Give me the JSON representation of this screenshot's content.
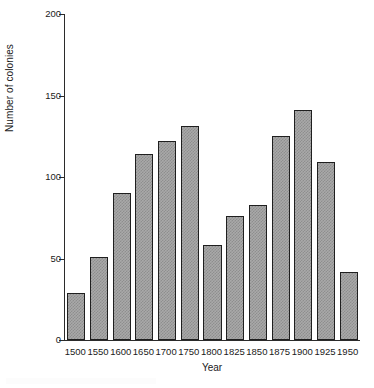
{
  "chart_data": {
    "type": "bar",
    "title": "",
    "xlabel": "Year",
    "ylabel": "Number of colonies",
    "categories": [
      "1500",
      "1550",
      "1600",
      "1650",
      "1700",
      "1750",
      "1800",
      "1825",
      "1850",
      "1875",
      "1900",
      "1925",
      "1950"
    ],
    "values": [
      29,
      51,
      90,
      114,
      122,
      131,
      58,
      76,
      83,
      125,
      141,
      109,
      42
    ],
    "ylim": [
      0,
      200
    ],
    "y_ticks": [
      0,
      50,
      100,
      150,
      200
    ],
    "y_tick_labels": [
      "0",
      "50",
      "100",
      "150",
      "200"
    ],
    "grid": false,
    "legend": "none",
    "bar_fill_color": "#a9a9a9",
    "bar_edge_color": "#1f1f1f",
    "background_color": "#ffffff",
    "axis_color": "#2b2b2b"
  }
}
